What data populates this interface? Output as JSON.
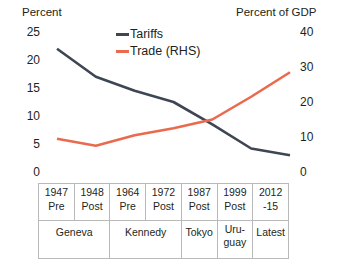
{
  "axes": {
    "left_title": "Percent",
    "right_title": "Percent of GDP",
    "left_ticks": [
      "25",
      "20",
      "15",
      "10",
      "5",
      "0"
    ],
    "right_ticks": [
      "40",
      "30",
      "20",
      "10",
      "0"
    ]
  },
  "legend": {
    "items": [
      {
        "label": "Tariffs",
        "color": "#3f4653"
      },
      {
        "label": "Trade (RHS)",
        "color": "#ea6a4e"
      }
    ]
  },
  "table": {
    "rounds": [
      {
        "year": "1947",
        "phase": "Pre"
      },
      {
        "year": "1948",
        "phase": "Post"
      },
      {
        "year": "1964",
        "phase": "Pre"
      },
      {
        "year": "1972",
        "phase": "Post"
      },
      {
        "year": "1987",
        "phase": "Post"
      },
      {
        "year": "1999",
        "phase": "Post"
      },
      {
        "year": "2012",
        "phase": "-15"
      }
    ],
    "groups": [
      {
        "line1": "Geneva",
        "line2": ""
      },
      {
        "line1": "Kennedy",
        "line2": ""
      },
      {
        "line1": "Tokyo",
        "line2": ""
      },
      {
        "line1": "Uru-",
        "line2": "guay"
      },
      {
        "line1": "Latest",
        "line2": ""
      }
    ]
  },
  "chart_data": {
    "type": "line",
    "title": "",
    "xlabel": "",
    "ylabel": "Percent",
    "y2label": "Percent of GDP",
    "grid": false,
    "legend_position": "top-center",
    "ylim": [
      0,
      25
    ],
    "y2lim": [
      0,
      40
    ],
    "categories": [
      "1947 Pre (Geneva)",
      "1948 Post (Geneva)",
      "1964 Pre (Kennedy)",
      "1972 Post (Kennedy)",
      "1987 Post (Tokyo)",
      "1999 Post (Uruguay)",
      "2012-15 (Latest)"
    ],
    "series": [
      {
        "name": "Tariffs",
        "axis": "left",
        "color": "#3f4653",
        "values": [
          22.0,
          17.0,
          14.5,
          12.5,
          8.5,
          4.2,
          3.0
        ]
      },
      {
        "name": "Trade (RHS)",
        "axis": "right",
        "color": "#ea6a4e",
        "values": [
          9.5,
          7.5,
          10.5,
          12.5,
          15.0,
          21.5,
          28.5
        ]
      }
    ]
  }
}
